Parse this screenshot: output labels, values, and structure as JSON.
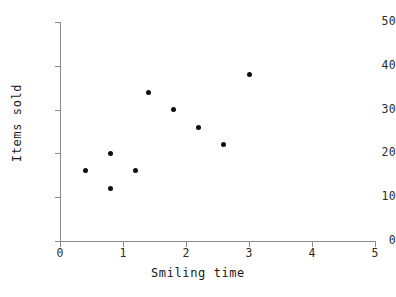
{
  "chart_data": {
    "type": "scatter",
    "title": "",
    "xlabel": "Smiling time",
    "ylabel": "Items sold",
    "xlim": [
      0,
      5
    ],
    "ylim": [
      0,
      50
    ],
    "xticks": [
      0,
      1,
      2,
      3,
      4,
      5
    ],
    "yticks": [
      0,
      10,
      20,
      30,
      40,
      50
    ],
    "xtick_labels": [
      "0",
      "1",
      "2",
      "3",
      "4",
      "5"
    ],
    "ytick_labels": [
      "0",
      "10",
      "20",
      "30",
      "40",
      "50"
    ],
    "grid": false,
    "legend": false,
    "marker": "filled-circle",
    "marker_color": "#0d0d0d",
    "axis_color": "#8a8a8a",
    "background_color": "#ffffff",
    "points": [
      {
        "x": 0.4,
        "y": 16
      },
      {
        "x": 0.8,
        "y": 20
      },
      {
        "x": 0.8,
        "y": 12
      },
      {
        "x": 1.2,
        "y": 16
      },
      {
        "x": 1.4,
        "y": 34
      },
      {
        "x": 1.8,
        "y": 30
      },
      {
        "x": 2.2,
        "y": 26
      },
      {
        "x": 2.6,
        "y": 22
      },
      {
        "x": 3.0,
        "y": 38
      }
    ]
  }
}
